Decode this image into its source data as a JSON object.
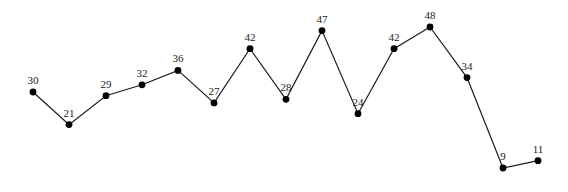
{
  "chart_data": {
    "type": "line",
    "title": "",
    "xlabel": "",
    "ylabel": "",
    "x": [
      1,
      2,
      3,
      4,
      5,
      6,
      7,
      8,
      9,
      10,
      11,
      12,
      13,
      14,
      15
    ],
    "values": [
      30,
      21,
      29,
      32,
      36,
      27,
      42,
      28,
      47,
      24,
      42,
      48,
      34,
      9,
      11
    ],
    "data_labels": [
      "30",
      "21",
      "29",
      "32",
      "36",
      "27",
      "42",
      "28",
      "47",
      "24",
      "42",
      "48",
      "34",
      "9",
      "11"
    ],
    "axes_visible": false,
    "grid": false,
    "legend": null,
    "markers": "filled-circle",
    "line_color": "#1a1a1a",
    "marker_color": "#000000"
  },
  "layout": {
    "x_pixels": [
      33,
      69,
      106,
      142,
      178,
      214,
      250,
      286,
      322,
      358,
      394,
      430,
      467,
      503,
      538
    ],
    "y_scale": {
      "offset": 200.5,
      "px_per_unit": 3.615
    }
  }
}
